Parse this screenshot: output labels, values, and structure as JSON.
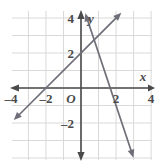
{
  "figure": {
    "background_color": "#ffffff",
    "grid_color": "#d9d9d9",
    "axis_color": "#4a4a4a",
    "line_color": "#6e6e78",
    "label_color": "#4a4a4a",
    "width": 165,
    "height": 168
  },
  "chart_data": {
    "type": "line",
    "title": "",
    "xlabel": "x",
    "ylabel": "y",
    "xlim": [
      -4.9,
      4.9
    ],
    "ylim": [
      -4.4,
      4.4
    ],
    "grid": true,
    "grid_step": 1,
    "legend": "none",
    "origin_label": "O",
    "xticks": [
      -4,
      -2,
      2,
      4
    ],
    "xtick_labels": [
      "–4",
      "–2",
      "2",
      "4"
    ],
    "yticks": [
      4,
      2,
      -2
    ],
    "ytick_labels": [
      "4",
      "2",
      "–2"
    ],
    "series": [
      {
        "name": "rising-line",
        "slope": 1,
        "intercept": 2,
        "x_intercept": -2,
        "y_intercept": 2,
        "points": [
          [
            -4,
            -2
          ],
          [
            -2,
            0
          ],
          [
            0,
            2
          ],
          [
            2,
            4
          ]
        ],
        "arrows": "both"
      },
      {
        "name": "falling-line",
        "slope": -3,
        "intercept": 5,
        "x_intercept": 1.7,
        "y_intercept": 5,
        "points": [
          [
            0.3,
            4.1
          ],
          [
            1.7,
            0
          ],
          [
            2.8,
            -3.4
          ]
        ],
        "arrows": "both"
      }
    ]
  },
  "axes": {
    "x_axis_name": "x",
    "y_axis_name": "y",
    "origin": "O"
  }
}
